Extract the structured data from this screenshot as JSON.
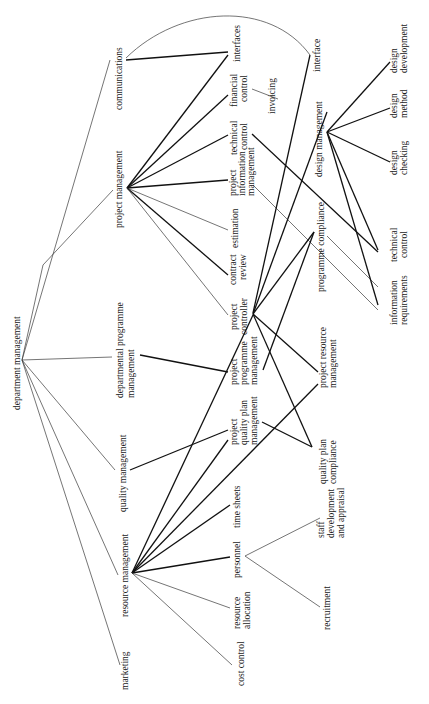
{
  "diagram": {
    "orientation": "rotated-90-ccw",
    "root": {
      "id": "department_management",
      "label": "department management"
    },
    "nodes": [
      {
        "id": "marketing",
        "lines": [
          "marketing"
        ]
      },
      {
        "id": "resource_management",
        "lines": [
          "resource management"
        ]
      },
      {
        "id": "quality_management",
        "lines": [
          "quality management"
        ]
      },
      {
        "id": "departmental_programme_management",
        "lines": [
          "departmental programme",
          "management"
        ]
      },
      {
        "id": "project_management",
        "lines": [
          "project management"
        ]
      },
      {
        "id": "communications",
        "lines": [
          "communications"
        ]
      },
      {
        "id": "cost_control",
        "lines": [
          "cost control"
        ]
      },
      {
        "id": "resource_allocation",
        "lines": [
          "resource",
          "allocation"
        ]
      },
      {
        "id": "personnel",
        "lines": [
          "personnel"
        ]
      },
      {
        "id": "time_sheets",
        "lines": [
          "time sheets"
        ]
      },
      {
        "id": "project_quality_plan_management",
        "lines": [
          "project",
          "quality plan",
          "management"
        ]
      },
      {
        "id": "project_programme_management",
        "lines": [
          "project",
          "programme",
          "management"
        ]
      },
      {
        "id": "project_controller",
        "lines": [
          "project",
          "controller"
        ]
      },
      {
        "id": "contract_review",
        "lines": [
          "contract",
          "review"
        ]
      },
      {
        "id": "estimation",
        "lines": [
          "estimation"
        ]
      },
      {
        "id": "project_information_management",
        "lines": [
          "project",
          "information",
          "management"
        ]
      },
      {
        "id": "technical_control_pm",
        "lines": [
          "technical",
          "control"
        ]
      },
      {
        "id": "financial_control",
        "lines": [
          "financial",
          "control"
        ]
      },
      {
        "id": "interfaces",
        "lines": [
          "interfaces"
        ]
      },
      {
        "id": "invoicing",
        "lines": [
          "invoicing"
        ]
      },
      {
        "id": "interface",
        "lines": [
          "interface"
        ]
      },
      {
        "id": "recruitment",
        "lines": [
          "recruitment"
        ]
      },
      {
        "id": "staff_development",
        "lines": [
          "staff",
          "development",
          "and appraisal"
        ]
      },
      {
        "id": "quality_plan_compliance",
        "lines": [
          "quality plan",
          "compliance"
        ]
      },
      {
        "id": "project_resource_management",
        "lines": [
          "project resource",
          "management"
        ]
      },
      {
        "id": "programme_compliance",
        "lines": [
          "programme compliance"
        ]
      },
      {
        "id": "design_management",
        "lines": [
          "design management"
        ]
      },
      {
        "id": "information_requirements",
        "lines": [
          "information",
          "requirements"
        ]
      },
      {
        "id": "technical_control_dm",
        "lines": [
          "technical",
          "control"
        ]
      },
      {
        "id": "design_checking",
        "lines": [
          "design",
          "checking"
        ]
      },
      {
        "id": "design_method",
        "lines": [
          "design",
          "method"
        ]
      },
      {
        "id": "design_development",
        "lines": [
          "design",
          "development"
        ]
      }
    ],
    "edges": [
      {
        "from": "department_management",
        "to": "marketing",
        "weight": "thin"
      },
      {
        "from": "department_management",
        "to": "resource_management",
        "weight": "thin"
      },
      {
        "from": "department_management",
        "to": "quality_management",
        "weight": "thin"
      },
      {
        "from": "department_management",
        "to": "departmental_programme_management",
        "weight": "thin"
      },
      {
        "from": "department_management",
        "to": "project_management",
        "weight": "thin"
      },
      {
        "from": "department_management",
        "to": "communications",
        "weight": "thin"
      },
      {
        "from": "resource_management",
        "to": "cost_control",
        "weight": "thin"
      },
      {
        "from": "resource_management",
        "to": "resource_allocation",
        "weight": "thin"
      },
      {
        "from": "resource_management",
        "to": "personnel",
        "weight": "thick"
      },
      {
        "from": "resource_management",
        "to": "time_sheets",
        "weight": "thick"
      },
      {
        "from": "resource_management",
        "to": "project_quality_plan_management",
        "weight": "thick"
      },
      {
        "from": "resource_management",
        "to": "project_resource_management",
        "weight": "thick"
      },
      {
        "from": "resource_management",
        "to": "project_controller",
        "weight": "thick"
      },
      {
        "from": "quality_management",
        "to": "project_quality_plan_management",
        "weight": "thick"
      },
      {
        "from": "departmental_programme_management",
        "to": "project_programme_management",
        "weight": "thick"
      },
      {
        "from": "project_management",
        "to": "project_controller",
        "weight": "thin"
      },
      {
        "from": "project_management",
        "to": "contract_review",
        "weight": "thick"
      },
      {
        "from": "project_management",
        "to": "estimation",
        "weight": "thin"
      },
      {
        "from": "project_management",
        "to": "project_information_management",
        "weight": "thick"
      },
      {
        "from": "project_management",
        "to": "technical_control_pm",
        "weight": "thick"
      },
      {
        "from": "project_management",
        "to": "financial_control",
        "weight": "thick"
      },
      {
        "from": "project_management",
        "to": "interfaces",
        "weight": "thick"
      },
      {
        "from": "communications",
        "to": "interfaces",
        "weight": "thick"
      },
      {
        "from": "communications",
        "to": "interface",
        "weight": "thin",
        "shape": "arc"
      },
      {
        "from": "financial_control",
        "to": "invoicing",
        "weight": "thin"
      },
      {
        "from": "personnel",
        "to": "recruitment",
        "weight": "thin"
      },
      {
        "from": "personnel",
        "to": "staff_development",
        "weight": "thin"
      },
      {
        "from": "project_quality_plan_management",
        "to": "quality_plan_compliance",
        "weight": "thick"
      },
      {
        "from": "project_controller",
        "to": "quality_plan_compliance",
        "weight": "thick"
      },
      {
        "from": "project_controller",
        "to": "project_resource_management",
        "weight": "thick"
      },
      {
        "from": "project_controller",
        "to": "programme_compliance",
        "weight": "thick"
      },
      {
        "from": "project_controller",
        "to": "interface",
        "weight": "thick"
      },
      {
        "from": "project_controller",
        "to": "design_management",
        "weight": "thick"
      },
      {
        "from": "project_programme_management",
        "to": "programme_compliance",
        "weight": "thick"
      },
      {
        "from": "project_information_management",
        "to": "information_requirements",
        "weight": "thin"
      },
      {
        "from": "technical_control_pm",
        "to": "technical_control_dm",
        "weight": "thick"
      },
      {
        "from": "design_management",
        "to": "design_development",
        "weight": "thick"
      },
      {
        "from": "design_management",
        "to": "design_method",
        "weight": "thick"
      },
      {
        "from": "design_management",
        "to": "design_checking",
        "weight": "thick"
      },
      {
        "from": "design_management",
        "to": "technical_control_dm",
        "weight": "thick"
      },
      {
        "from": "design_management",
        "to": "information_requirements",
        "weight": "thick"
      }
    ]
  }
}
